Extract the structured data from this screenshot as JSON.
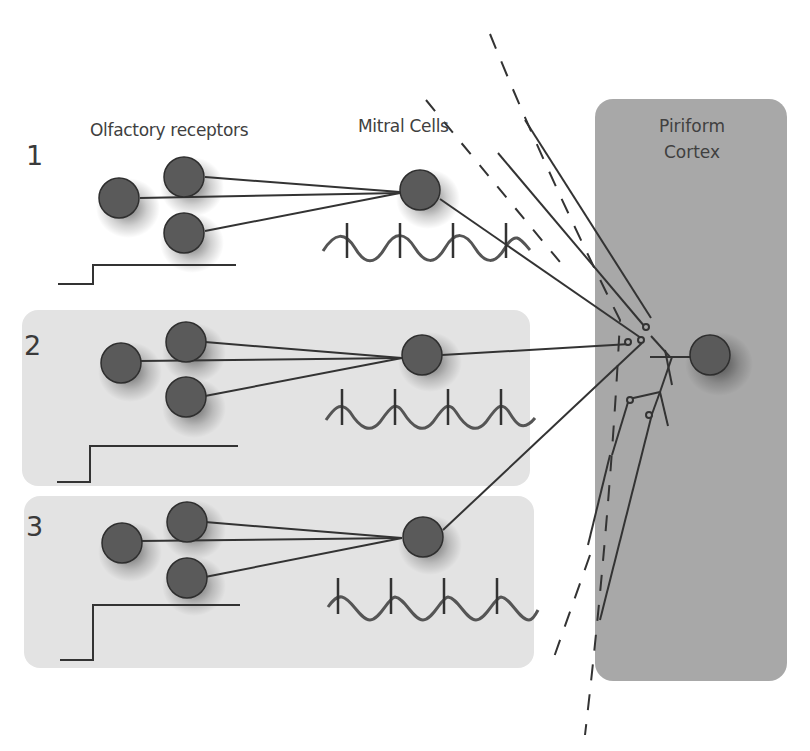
{
  "labels": {
    "olfactory_receptors": "Olfactory receptors",
    "mitral_cells": "Mitral Cells",
    "piriform_line1": "Piriform",
    "piriform_line2": "Cortex"
  },
  "rows": [
    {
      "number": "1",
      "highlighted": false,
      "step_height": "small"
    },
    {
      "number": "2",
      "highlighted": true,
      "step_height": "medium"
    },
    {
      "number": "3",
      "highlighted": true,
      "step_height": "large"
    }
  ],
  "colors": {
    "background": "#ffffff",
    "row_box": "#e3e3e3",
    "cortex_box": "#a8a8a8",
    "neuron_fill": "#5a5a5a",
    "neuron_stroke": "#2e2e2e",
    "line": "#333333",
    "wave": "#555555",
    "text": "#404040"
  }
}
